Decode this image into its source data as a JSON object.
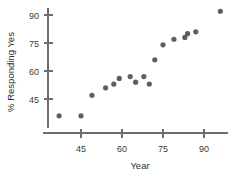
{
  "chart_data": {
    "type": "scatter",
    "title": "",
    "xlabel": "Year",
    "ylabel": "% Responding Yes",
    "xlim": [
      36,
      100
    ],
    "ylim": [
      33,
      96
    ],
    "xticks": [
      45,
      60,
      75,
      90
    ],
    "xticklabels": [
      "45",
      "60",
      "75",
      "90"
    ],
    "yticks": [
      45,
      60,
      75,
      90
    ],
    "yticklabels": [
      "45",
      "60",
      "75",
      "90"
    ],
    "grid": false,
    "legend": null,
    "marker": "filled-circle",
    "marker_color": "#5e5e5e",
    "axis_color": "#6e6e6e",
    "points": [
      {
        "x": 37,
        "y": 36
      },
      {
        "x": 45,
        "y": 36
      },
      {
        "x": 49,
        "y": 47
      },
      {
        "x": 54,
        "y": 51
      },
      {
        "x": 57,
        "y": 53
      },
      {
        "x": 59,
        "y": 56
      },
      {
        "x": 63,
        "y": 57
      },
      {
        "x": 65,
        "y": 54
      },
      {
        "x": 68,
        "y": 57
      },
      {
        "x": 70,
        "y": 53
      },
      {
        "x": 72,
        "y": 66
      },
      {
        "x": 75,
        "y": 74
      },
      {
        "x": 79,
        "y": 77
      },
      {
        "x": 83,
        "y": 78
      },
      {
        "x": 84,
        "y": 80
      },
      {
        "x": 87,
        "y": 81
      },
      {
        "x": 96,
        "y": 92
      }
    ]
  },
  "axes": {
    "x_title": "Year",
    "y_title": "% Responding Yes"
  },
  "x_tick_labels": [
    "45",
    "60",
    "75",
    "90"
  ],
  "y_tick_labels": [
    "90",
    "75",
    "60",
    "45"
  ]
}
